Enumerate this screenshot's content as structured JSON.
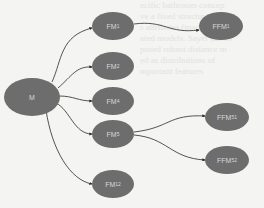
{
  "diagram": {
    "type": "tree",
    "root": "M",
    "nodes": [
      {
        "id": "M",
        "label": "M",
        "sub": "",
        "x": 4,
        "y": 78,
        "w": 56,
        "h": 38
      },
      {
        "id": "FM1",
        "label": "FM",
        "sub": "1",
        "x": 92,
        "y": 12,
        "w": 42,
        "h": 28
      },
      {
        "id": "FM2",
        "label": "FM",
        "sub": "2",
        "x": 92,
        "y": 52,
        "w": 42,
        "h": 28
      },
      {
        "id": "FM4",
        "label": "FM",
        "sub": "4",
        "x": 92,
        "y": 87,
        "w": 42,
        "h": 28
      },
      {
        "id": "FM5",
        "label": "FM",
        "sub": "5",
        "x": 92,
        "y": 120,
        "w": 42,
        "h": 28
      },
      {
        "id": "FM12",
        "label": "FM",
        "sub": "12",
        "x": 92,
        "y": 170,
        "w": 42,
        "h": 28
      },
      {
        "id": "FFM1",
        "label": "FFM",
        "sub": "1",
        "x": 199,
        "y": 12,
        "w": 44,
        "h": 28
      },
      {
        "id": "FFM51",
        "label": "FFM",
        "sub": "51",
        "x": 205,
        "y": 106,
        "w": 44,
        "h": 28
      },
      {
        "id": "FFM52",
        "label": "FFM",
        "sub": "52",
        "x": 205,
        "y": 143,
        "w": 44,
        "h": 28
      }
    ],
    "edges": [
      {
        "from": "M",
        "to": "FM1"
      },
      {
        "from": "M",
        "to": "FM2"
      },
      {
        "from": "M",
        "to": "FM4"
      },
      {
        "from": "M",
        "to": "FM5"
      },
      {
        "from": "M",
        "to": "FM12"
      },
      {
        "from": "FM1",
        "to": "FFM1"
      },
      {
        "from": "FM5",
        "to": "FFM51"
      },
      {
        "from": "FM5",
        "to": "FFM52"
      }
    ],
    "colors": {
      "node_fill": "#6d6d6d",
      "node_text": "#d8d8d8",
      "edge": "#2a2a2a",
      "background": "#f4f4f2"
    }
  },
  "nodes": {
    "M": {
      "label": "M",
      "sub": ""
    },
    "FM1": {
      "label": "FM",
      "sub": "1"
    },
    "FM2": {
      "label": "FM",
      "sub": "2"
    },
    "FM4": {
      "label": "FM",
      "sub": "4"
    },
    "FM5": {
      "label": "FM",
      "sub": "5"
    },
    "FM12": {
      "label": "FM",
      "sub": "12"
    },
    "FFM1": {
      "label": "FFM",
      "sub": "1"
    },
    "FFM51": {
      "label": "FFM",
      "sub": "51"
    },
    "FFM52": {
      "label": "FFM",
      "sub": "52"
    }
  }
}
